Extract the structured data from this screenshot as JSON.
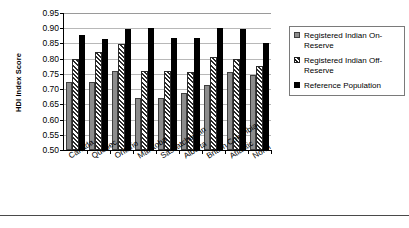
{
  "chart_data": {
    "type": "bar",
    "title": "",
    "xlabel": "",
    "ylabel": "HDI Index Score",
    "ylim": [
      0.5,
      0.95
    ],
    "ytick_step": 0.05,
    "grid": true,
    "legend_position": "right",
    "categories": [
      "Canada",
      "Québec",
      "Ontario",
      "Manitoba",
      "Saskatchewan",
      "Alberta",
      "British Columbia",
      "Atlantic",
      "North"
    ],
    "ytick_labels": [
      "0.95",
      "0.90",
      "0.85",
      "0.80",
      "0.75",
      "0.70",
      "0.65",
      "0.60",
      "0.55",
      "0.50"
    ],
    "ytick_values": [
      0.95,
      0.9,
      0.85,
      0.8,
      0.75,
      0.7,
      0.65,
      0.6,
      0.55,
      0.5
    ],
    "series": [
      {
        "name": "Registered Indian On-Reserve",
        "style": "solid-gray",
        "color": "#8c8c8c",
        "values": [
          0.723,
          0.724,
          0.758,
          0.672,
          0.672,
          0.687,
          0.712,
          0.757,
          0.745
        ]
      },
      {
        "name": "Registered Indian Off-Reserve",
        "style": "hatched",
        "color": "#2b2b2b",
        "values": [
          0.8,
          0.822,
          0.848,
          0.758,
          0.758,
          0.755,
          0.805,
          0.8,
          0.775
        ]
      },
      {
        "name": "Reference Population",
        "style": "solid-black",
        "color": "#000000",
        "values": [
          0.879,
          0.865,
          0.899,
          0.9,
          0.868,
          0.867,
          0.9,
          0.899,
          0.853
        ]
      }
    ]
  },
  "legend": {
    "items": [
      {
        "label": "Registered Indian On-Reserve"
      },
      {
        "label": "Registered Indian Off-Reserve"
      },
      {
        "label": "Reference Population"
      }
    ]
  }
}
